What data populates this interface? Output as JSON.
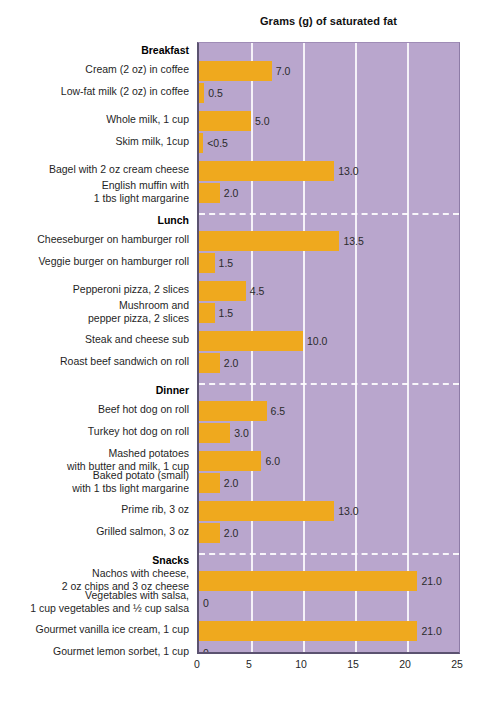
{
  "chart_data": {
    "type": "bar",
    "orientation": "horizontal",
    "title": "Grams (g) of saturated fat",
    "xlabel": "",
    "ylabel": "",
    "xlim": [
      0,
      25
    ],
    "xticks": [
      0,
      5,
      10,
      15,
      20,
      25
    ],
    "xtick_labels": [
      "0",
      "5",
      "10",
      "15",
      "20",
      "25"
    ],
    "grid": true,
    "legend": "none",
    "colors": {
      "bar": "#efa91e",
      "plot_background": "#b9a6cd",
      "gridline": "#ffffff",
      "divider": "#ffffff",
      "axis": "#5b5270",
      "text": "#1f1f1f"
    },
    "sections": [
      {
        "name": "Breakfast",
        "items": [
          {
            "label": [
              "Cream (2 oz) in coffee"
            ],
            "value": 7.0,
            "value_label": "7.0"
          },
          {
            "label": [
              "Low-fat milk (2 oz) in coffee"
            ],
            "value": 0.5,
            "value_label": "0.5"
          },
          {
            "label": [
              "Whole milk, 1 cup"
            ],
            "value": 5.0,
            "value_label": "5.0"
          },
          {
            "label": [
              "Skim milk, 1cup"
            ],
            "value": 0.4,
            "value_label": "<0.5"
          },
          {
            "label": [
              "Bagel with 2 oz cream cheese"
            ],
            "value": 13.0,
            "value_label": "13.0"
          },
          {
            "label": [
              "English muffin with",
              "1 tbs light margarine"
            ],
            "value": 2.0,
            "value_label": "2.0"
          }
        ]
      },
      {
        "name": "Lunch",
        "items": [
          {
            "label": [
              "Cheeseburger on hamburger roll"
            ],
            "value": 13.5,
            "value_label": "13.5"
          },
          {
            "label": [
              "Veggie burger on hamburger roll"
            ],
            "value": 1.5,
            "value_label": "1.5"
          },
          {
            "label": [
              "Pepperoni pizza, 2 slices"
            ],
            "value": 4.5,
            "value_label": "4.5"
          },
          {
            "label": [
              "Mushroom and",
              "pepper pizza, 2 slices"
            ],
            "value": 1.5,
            "value_label": "1.5"
          },
          {
            "label": [
              "Steak and cheese sub"
            ],
            "value": 10.0,
            "value_label": "10.0"
          },
          {
            "label": [
              "Roast beef sandwich on roll"
            ],
            "value": 2.0,
            "value_label": "2.0"
          }
        ]
      },
      {
        "name": "Dinner",
        "items": [
          {
            "label": [
              "Beef hot dog on roll"
            ],
            "value": 6.5,
            "value_label": "6.5"
          },
          {
            "label": [
              "Turkey hot dog on roll"
            ],
            "value": 3.0,
            "value_label": "3.0"
          },
          {
            "label": [
              "Mashed potatoes",
              "with butter and milk, 1 cup"
            ],
            "value": 6.0,
            "value_label": "6.0"
          },
          {
            "label": [
              "Baked potato (small)",
              "with 1 tbs light margarine"
            ],
            "value": 2.0,
            "value_label": "2.0"
          },
          {
            "label": [
              "Prime rib, 3 oz"
            ],
            "value": 13.0,
            "value_label": "13.0"
          },
          {
            "label": [
              "Grilled salmon, 3 oz"
            ],
            "value": 2.0,
            "value_label": "2.0"
          }
        ]
      },
      {
        "name": "Snacks",
        "items": [
          {
            "label": [
              "Nachos with cheese,",
              "2 oz chips and 3 oz cheese"
            ],
            "value": 21.0,
            "value_label": "21.0"
          },
          {
            "label": [
              "Vegetables with salsa,",
              "1 cup vegetables and ½ cup salsa"
            ],
            "value": 0,
            "value_label": "0"
          },
          {
            "label": [
              "Gourmet vanilla ice cream, 1 cup"
            ],
            "value": 21.0,
            "value_label": "21.0"
          },
          {
            "label": [
              "Gourmet lemon sorbet, 1 cup"
            ],
            "value": 0,
            "value_label": "0"
          }
        ]
      }
    ]
  },
  "layout": {
    "plot_left": 197,
    "plot_top": 42,
    "plot_width": 263,
    "plot_height": 612
  }
}
